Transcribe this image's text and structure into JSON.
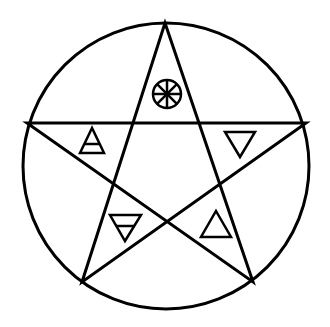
{
  "diagram": {
    "stroke_color": "#000000",
    "background": "#ffffff",
    "circle": {
      "cx": 166,
      "cy": 166,
      "r": 143
    },
    "star_vertices": [
      {
        "name": "top",
        "x": 165,
        "y": 23
      },
      {
        "name": "right",
        "x": 306,
        "y": 123
      },
      {
        "name": "bottom-right",
        "x": 253,
        "y": 282
      },
      {
        "name": "bottom-left",
        "x": 82,
        "y": 282
      },
      {
        "name": "left",
        "x": 27,
        "y": 123
      }
    ],
    "symbols": [
      {
        "position": "top",
        "symbol": "spirit-wheel-icon",
        "meaning": "Spirit"
      },
      {
        "position": "upper-left",
        "symbol": "air-triangle-icon",
        "meaning": "Air"
      },
      {
        "position": "upper-right",
        "symbol": "water-triangle-icon",
        "meaning": "Water"
      },
      {
        "position": "lower-left",
        "symbol": "earth-triangle-icon",
        "meaning": "Earth"
      },
      {
        "position": "lower-right",
        "symbol": "fire-triangle-icon",
        "meaning": "Fire"
      }
    ]
  }
}
